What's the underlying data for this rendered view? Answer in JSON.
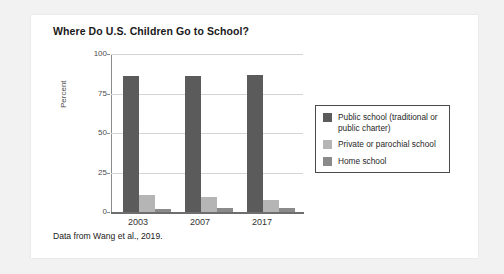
{
  "figure": {
    "title": "Where Do U.S. Children Go to School?",
    "caption": "Data from Wang et al., 2019."
  },
  "chart_data": {
    "type": "bar",
    "title": "Where Do U.S. Children Go to School?",
    "xlabel": "",
    "ylabel": "Percent",
    "ylim": [
      0,
      100
    ],
    "yticks": [
      0,
      25,
      50,
      75,
      100
    ],
    "grid": true,
    "legend_position": "right",
    "categories": [
      "2003",
      "2007",
      "2017"
    ],
    "series": [
      {
        "name": "Public school (traditional or public charter)",
        "color": "#5b5b5b",
        "values": [
          86,
          86,
          87
        ]
      },
      {
        "name": "Private or parochial school",
        "color": "#b5b5b5",
        "values": [
          10.5,
          9.5,
          7.5
        ]
      },
      {
        "name": "Home school",
        "color": "#8a8a8a",
        "values": [
          2,
          2.5,
          2.5
        ]
      }
    ],
    "annotation": "Data from Wang et al., 2019."
  },
  "axis": {
    "y_tick_labels": [
      "100",
      "75",
      "50",
      "25",
      "0"
    ],
    "y_title": "Percent",
    "x_tick_labels": [
      "2003",
      "2007",
      "2017"
    ]
  },
  "legend": {
    "entries": [
      {
        "label": "Public school (traditional or public charter)",
        "color": "#5b5b5b"
      },
      {
        "label": "Private or parochial school",
        "color": "#b5b5b5"
      },
      {
        "label": "Home school",
        "color": "#8a8a8a"
      }
    ]
  },
  "colors": {
    "page_background": "#f2f2f2",
    "card_background": "#ffffff",
    "gridline": "#d4d4d4",
    "axis": "#6e6e6e",
    "text": "#1a1a1a"
  }
}
